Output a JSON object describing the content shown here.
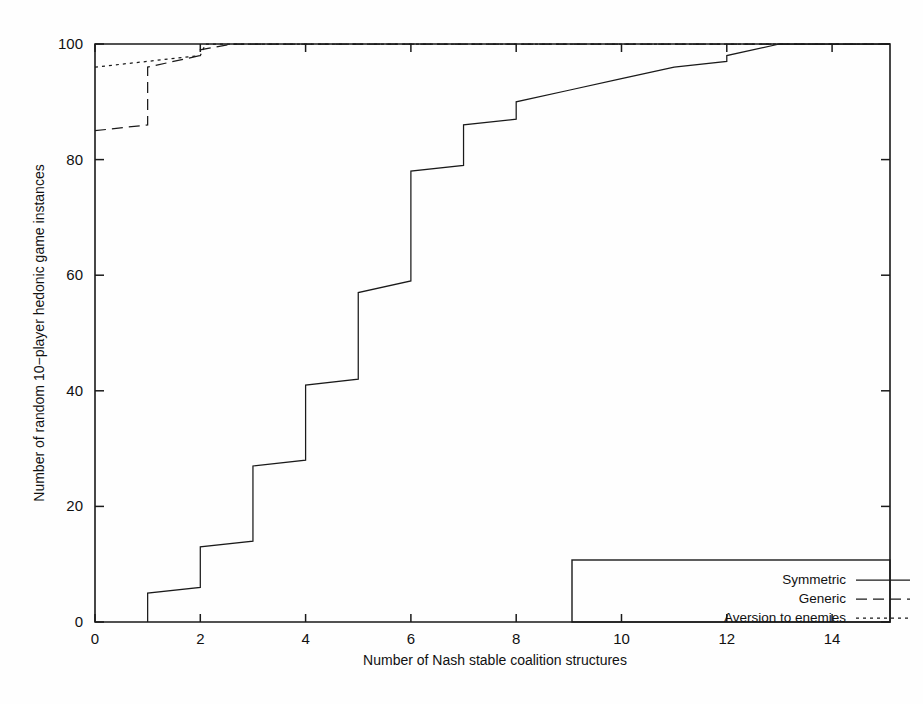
{
  "chart_data": {
    "type": "line",
    "title": "",
    "subtitle": "",
    "xlabel": "Number of Nash stable coalition structures",
    "ylabel": "Number of random 10−player hedonic game instances",
    "xlim": [
      0,
      15.1
    ],
    "ylim": [
      0,
      100
    ],
    "xticks": [
      0,
      2,
      4,
      6,
      8,
      10,
      12,
      14
    ],
    "xtick_labels": [
      "0",
      "2",
      "4",
      "6",
      "8",
      "10",
      "12",
      "14"
    ],
    "yticks": [
      0,
      20,
      40,
      60,
      80,
      100
    ],
    "ytick_labels": [
      "0",
      "20",
      "40",
      "60",
      "80",
      "100"
    ],
    "grid": false,
    "legend_position": "bottom-right",
    "step_style": "cumulative step (post) with interpolated risers",
    "series": [
      {
        "name": "Symmetric",
        "style": "solid",
        "color": "#1a1a1a",
        "x": [
          1,
          1,
          2,
          2,
          3,
          3,
          4,
          4,
          5,
          5,
          6,
          6,
          7,
          7,
          8,
          8,
          9,
          9,
          10,
          11,
          12,
          12,
          13,
          15.1
        ],
        "y": [
          0,
          5,
          6,
          13,
          14,
          27,
          28,
          41,
          42,
          57,
          59,
          78,
          79,
          86,
          87,
          90,
          92,
          92,
          94,
          96,
          97,
          98,
          100,
          100
        ]
      },
      {
        "name": "Generic",
        "style": "dashed",
        "color": "#1a1a1a",
        "x": [
          0,
          1,
          1,
          2,
          2,
          2.6,
          15.1
        ],
        "y": [
          85,
          86,
          96,
          98,
          99,
          100,
          100
        ]
      },
      {
        "name": "Aversion to enemies",
        "style": "dotted",
        "color": "#1a1a1a",
        "x": [
          0,
          1,
          2,
          2.1,
          15.1
        ],
        "y": [
          96,
          97,
          98,
          100,
          100
        ]
      }
    ]
  },
  "legend": {
    "entries": [
      {
        "label": "Symmetric",
        "style": "solid"
      },
      {
        "label": "Generic",
        "style": "dashed"
      },
      {
        "label": "Aversion to enemies",
        "style": "dotted"
      }
    ]
  }
}
